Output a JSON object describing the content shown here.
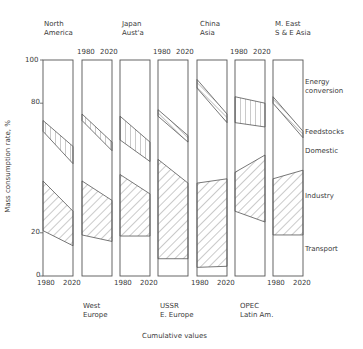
{
  "chart_data": {
    "type": "area",
    "title": "",
    "xlabel": "Cumulative values",
    "ylabel": "Mass consumption rate, %",
    "ylim": [
      0,
      100
    ],
    "yticks": [
      0,
      20,
      80,
      100
    ],
    "x": [
      1980,
      2020
    ],
    "grid": false,
    "layers": [
      "Transport",
      "Industry",
      "Domestic",
      "Feedstocks",
      "Energy conversion"
    ],
    "layer_note": "Boundaries are cumulative %. Hatched bands: Industry (diagonal) between industry_bottom and industry_top; Feedstocks (vertical/diagonal) between feed_bottom and feed_top.",
    "panels": [
      {
        "region": "North America",
        "label_lines": [
          "North",
          "America"
        ],
        "label_pos": "top",
        "industry_bottom": [
          21,
          14
        ],
        "industry_top": [
          44,
          30
        ],
        "feed_bottom": [
          67,
          52
        ],
        "feed_top": [
          72,
          60
        ],
        "feed_hatch": "vertical"
      },
      {
        "region": "West Europe",
        "label_lines": [
          "West",
          "Europe"
        ],
        "label_pos": "bottom",
        "industry_bottom": [
          19,
          16
        ],
        "industry_top": [
          44,
          35
        ],
        "feed_bottom": [
          72,
          58
        ],
        "feed_top": [
          75,
          62
        ],
        "feed_hatch": "vertical"
      },
      {
        "region": "Japan Aust'a",
        "label_lines": [
          "Japan",
          "Aust'a"
        ],
        "label_pos": "top",
        "industry_bottom": [
          18.5,
          18.5
        ],
        "industry_top": [
          47,
          38
        ],
        "feed_bottom": [
          63,
          53
        ],
        "feed_top": [
          74,
          62
        ],
        "feed_hatch": "vertical"
      },
      {
        "region": "USSR E. Europe",
        "label_lines": [
          "USSR",
          "E. Europe"
        ],
        "label_pos": "bottom",
        "industry_bottom": [
          8,
          8
        ],
        "industry_top": [
          54,
          43
        ],
        "feed_bottom": [
          74,
          62
        ],
        "feed_top": [
          77,
          65
        ],
        "feed_hatch": "diagonal"
      },
      {
        "region": "China Asia",
        "label_lines": [
          "China",
          "Asia"
        ],
        "label_pos": "top",
        "industry_bottom": [
          4,
          4.5
        ],
        "industry_top": [
          43,
          45
        ],
        "feed_bottom": [
          87,
          71
        ],
        "feed_top": [
          91,
          75
        ],
        "feed_hatch": "diagonal"
      },
      {
        "region": "OPEC Latin Am.",
        "label_lines": [
          "OPEC",
          "Latin Am."
        ],
        "label_pos": "bottom",
        "industry_bottom": [
          30,
          25
        ],
        "industry_top": [
          48,
          56
        ],
        "feed_bottom": [
          71,
          69
        ],
        "feed_top": [
          83,
          80
        ],
        "feed_hatch": "vertical"
      },
      {
        "region": "M. East S & E Asia",
        "label_lines": [
          "M. East",
          "S & E  Asia"
        ],
        "label_pos": "top",
        "industry_bottom": [
          19,
          19
        ],
        "industry_top": [
          45,
          49
        ],
        "feed_bottom": [
          80,
          64
        ],
        "feed_top": [
          83,
          67
        ],
        "feed_hatch": "diagonal"
      }
    ],
    "legend_right": [
      "Energy conversion",
      "Feedstocks",
      "Domestic",
      "Industry",
      "Transport"
    ]
  },
  "labels": {
    "ylabel": "Mass consumption rate, %",
    "xlabel": "Cumulative values",
    "tick_100": "100",
    "tick_80": "80",
    "tick_20": "20",
    "tick_0": "0",
    "year_start": "1980",
    "year_end": "2020",
    "region_top": [
      [
        "North",
        "America"
      ],
      [
        "Japan",
        "Aust'a"
      ],
      [
        "China",
        "Asia"
      ],
      [
        "M. East",
        "S & E  Asia"
      ]
    ],
    "region_bottom": [
      [
        "West",
        "Europe"
      ],
      [
        "USSR",
        "E. Europe"
      ],
      [
        "OPEC",
        "Latin Am."
      ]
    ],
    "legend": {
      "energy_1": "Energy",
      "energy_2": "conversion",
      "feedstocks": "Feedstocks",
      "domestic": "Domestic",
      "industry": "Industry",
      "transport": "Transport"
    }
  }
}
